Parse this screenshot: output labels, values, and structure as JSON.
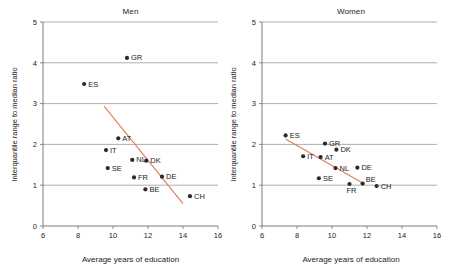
{
  "figure": {
    "background": "#ffffff",
    "point_color": "#2a2a2a",
    "trend_color": "#e07a53",
    "grid_color": "#8c8c8c"
  },
  "axis": {
    "xlabel": "Average years of education",
    "ylabel": "Interquantile range to median ratio",
    "xticks": [
      "6",
      "8",
      "10",
      "12",
      "14",
      "16"
    ],
    "yticks": [
      "0",
      "1",
      "2",
      "3",
      "4",
      "5"
    ]
  },
  "chart_data": [
    {
      "type": "scatter",
      "title": "Men",
      "xlabel": "Average years of education",
      "ylabel": "Interquantile range to median ratio",
      "xlim": [
        6,
        16
      ],
      "ylim": [
        0,
        5
      ],
      "xticks": [
        6,
        8,
        10,
        12,
        14,
        16
      ],
      "yticks": [
        0,
        1,
        2,
        3,
        4,
        5
      ],
      "grid": "horizontal",
      "legend": "none",
      "point_labels": [
        "GR",
        "ES",
        "AT",
        "IT",
        "NL",
        "DK",
        "SE",
        "FR",
        "DE",
        "BE",
        "CH"
      ],
      "points": [
        {
          "label": "GR",
          "x": 10.8,
          "y": 4.12
        },
        {
          "label": "ES",
          "x": 8.35,
          "y": 3.48
        },
        {
          "label": "AT",
          "x": 10.3,
          "y": 2.15
        },
        {
          "label": "IT",
          "x": 9.6,
          "y": 1.86
        },
        {
          "label": "NL",
          "x": 11.1,
          "y": 1.62
        },
        {
          "label": "DK",
          "x": 11.9,
          "y": 1.6
        },
        {
          "label": "SE",
          "x": 9.7,
          "y": 1.42
        },
        {
          "label": "FR",
          "x": 11.2,
          "y": 1.19
        },
        {
          "label": "DE",
          "x": 12.8,
          "y": 1.21
        },
        {
          "label": "BE",
          "x": 11.85,
          "y": 0.9
        },
        {
          "label": "CH",
          "x": 14.4,
          "y": 0.73
        }
      ],
      "trendline": {
        "x1": 9.5,
        "y1": 2.93,
        "x2": 14.0,
        "y2": 0.55
      }
    },
    {
      "type": "scatter",
      "title": "Women",
      "xlabel": "Average years of education",
      "ylabel": "Interquantile range to median ratio",
      "xlim": [
        6,
        16
      ],
      "ylim": [
        0,
        5
      ],
      "xticks": [
        6,
        8,
        10,
        12,
        14,
        16
      ],
      "yticks": [
        0,
        1,
        2,
        3,
        4,
        5
      ],
      "grid": "horizontal",
      "legend": "none",
      "point_labels": [
        "ES",
        "GR",
        "DK",
        "IT",
        "AT",
        "NL",
        "DE",
        "SE",
        "FR",
        "BE",
        "CH"
      ],
      "points": [
        {
          "label": "ES",
          "x": 7.35,
          "y": 2.22
        },
        {
          "label": "GR",
          "x": 9.6,
          "y": 2.02
        },
        {
          "label": "DK",
          "x": 10.25,
          "y": 1.87
        },
        {
          "label": "IT",
          "x": 8.35,
          "y": 1.71
        },
        {
          "label": "AT",
          "x": 9.35,
          "y": 1.69
        },
        {
          "label": "NL",
          "x": 10.2,
          "y": 1.42
        },
        {
          "label": "DE",
          "x": 11.45,
          "y": 1.43
        },
        {
          "label": "SE",
          "x": 9.25,
          "y": 1.17
        },
        {
          "label": "FR",
          "x": 11.0,
          "y": 1.03
        },
        {
          "label": "BE",
          "x": 11.75,
          "y": 1.04
        },
        {
          "label": "CH",
          "x": 12.55,
          "y": 0.98
        }
      ],
      "trendline": {
        "x1": 7.35,
        "y1": 2.13,
        "x2": 11.85,
        "y2": 1.03
      }
    }
  ]
}
